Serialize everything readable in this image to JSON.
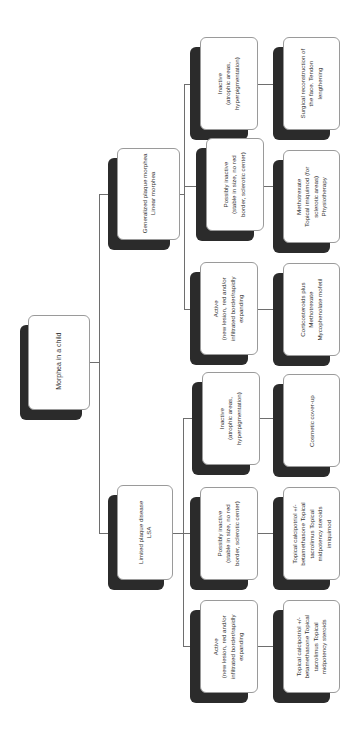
{
  "diagram": {
    "title": "Morphea in a child",
    "orientation": "rotated-90-ccw",
    "colors": {
      "box_fill": "#ffffff",
      "box_border": "#9a9a9a",
      "shadow": "#2b2b2b",
      "text": "#333333",
      "connector": "#6e6e6e"
    },
    "root": {
      "label": "Morphea in a child"
    },
    "branches": [
      {
        "label": "Generalized plaque morphea\nLinear morphea",
        "children": [
          {
            "label": "Inactive\n(atrophic areas,\nhyperpigmentation)",
            "treatment": "Surgical reconstruction of\nthe face. Tendon\nlengthening"
          },
          {
            "label": "Possibly inactive\n(stable in size, no red\nborder, sclerotic center)",
            "treatment": "Methotrexate\nTopical imiquimod (for\nsclerotic areas)\nPhysiotherapy"
          },
          {
            "label": "Active\n(new lesion, red and/or\ninfiltrated border/rapidly\nexpanding",
            "treatment": "Corticosteroids plus\nMethotrexate\nMycophenolate mofetil"
          }
        ]
      },
      {
        "label": "Limited plaque disease\nLSA",
        "children": [
          {
            "label": "Inactive\n(atrophic areas,\nhyperpigmentation)",
            "treatment": "Cosmetic cover-up"
          },
          {
            "label": "Possibly inactive\n(stable in size, no red\nborder, sclerotic center)",
            "treatment": "Topical calcipotriol +/-\nbetamethasone Topical\ntacrolimus Topical\nmidpotency steroids\nimiquimod"
          },
          {
            "label": "Active\n(new lesion, red and/or\ninfiltrated border/rapidly\nexpanding",
            "treatment": "Topical calcipotriol +/-\nbetamethasone Topical\ntacrolimus Topical\nmidpotency steroids"
          }
        ]
      }
    ]
  }
}
